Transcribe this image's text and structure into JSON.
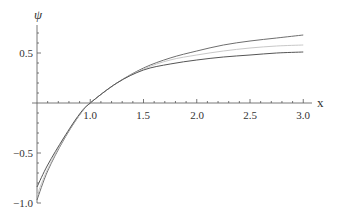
{
  "chart_data": {
    "type": "line",
    "title": "",
    "xlabel": "x",
    "ylabel": "ψ",
    "xlim": [
      0.5,
      3.0
    ],
    "ylim": [
      -1.0,
      0.75
    ],
    "grid": false,
    "legend": null,
    "x_ticks": [
      "1.0",
      "1.5",
      "2.0",
      "2.5",
      "3.0"
    ],
    "y_ticks": [
      "-1.0",
      "-0.5",
      "0.5"
    ],
    "x": [
      0.5,
      0.6,
      0.75,
      0.9,
      1.0,
      1.25,
      1.5,
      1.75,
      2.0,
      2.25,
      2.5,
      2.75,
      3.0
    ],
    "series": [
      {
        "name": "curve-1",
        "color": "#6e6e6e",
        "values": [
          -0.97,
          -0.68,
          -0.37,
          -0.12,
          0.0,
          0.2,
          0.35,
          0.45,
          0.52,
          0.58,
          0.62,
          0.65,
          0.68
        ]
      },
      {
        "name": "curve-2",
        "color": "#c8c8c8",
        "values": [
          -0.92,
          -0.66,
          -0.36,
          -0.12,
          0.0,
          0.2,
          0.34,
          0.43,
          0.48,
          0.52,
          0.55,
          0.57,
          0.58
        ]
      },
      {
        "name": "curve-3",
        "color": "#555555",
        "values": [
          -0.84,
          -0.62,
          -0.35,
          -0.11,
          0.0,
          0.2,
          0.33,
          0.39,
          0.43,
          0.46,
          0.48,
          0.5,
          0.51
        ]
      }
    ]
  },
  "axes": {
    "x_label": "x",
    "y_label": "ψ",
    "x_tick_labels": [
      "1.0",
      "1.5",
      "2.0",
      "2.5",
      "3.0"
    ],
    "y_tick_labels": [
      "0.5",
      "−0.5",
      "−1.0"
    ]
  }
}
